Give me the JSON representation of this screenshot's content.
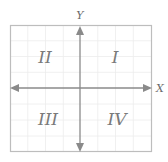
{
  "diagram": {
    "type": "coordinate-plane-quadrants",
    "axes": {
      "x_label": "X",
      "y_label": "Y"
    },
    "quadrants": [
      {
        "id": "q1",
        "label": "I",
        "position": "top-right"
      },
      {
        "id": "q2",
        "label": "II",
        "position": "top-left"
      },
      {
        "id": "q3",
        "label": "III",
        "position": "bottom-left"
      },
      {
        "id": "q4",
        "label": "IV",
        "position": "bottom-right"
      }
    ],
    "colors": {
      "border": "#bdbdbd",
      "grid": "#ececec",
      "axis": "#8a8a8a",
      "label": "#7a7a7a"
    }
  }
}
